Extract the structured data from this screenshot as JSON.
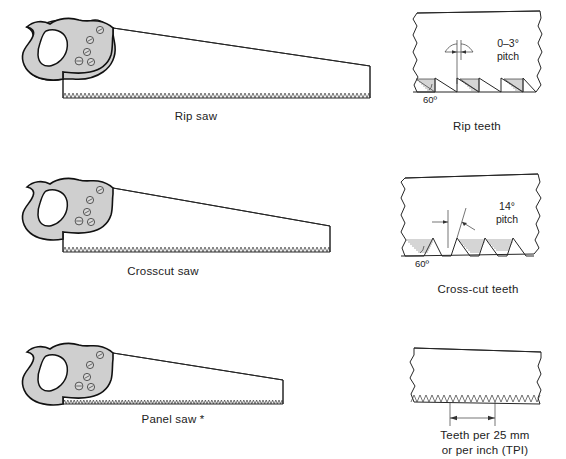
{
  "figure": {
    "background_color": "#ffffff",
    "line_color": "#262626",
    "handle_fill": "#cfcfcf"
  },
  "rows": [
    {
      "id": "rip",
      "saw": {
        "label": "Rip saw",
        "icon": "handsaw-icon"
      },
      "detail": {
        "label": "Rip teeth",
        "pitch_label": "0–3°",
        "pitch_word": "pitch",
        "angle_label": "60º",
        "icon": "saw-teeth-detail-icon"
      }
    },
    {
      "id": "crosscut",
      "saw": {
        "label": "Crosscut saw",
        "icon": "handsaw-icon"
      },
      "detail": {
        "label": "Cross-cut teeth",
        "pitch_label": "14°",
        "pitch_word": "pitch",
        "angle_label": "60º",
        "icon": "saw-teeth-detail-icon"
      }
    },
    {
      "id": "panel",
      "saw": {
        "label": "Panel saw *",
        "icon": "handsaw-icon"
      },
      "detail": {
        "label_line1": "Teeth per 25 mm",
        "label_line2": "or per inch (TPI)",
        "icon": "teeth-pitch-measure-icon"
      }
    }
  ]
}
